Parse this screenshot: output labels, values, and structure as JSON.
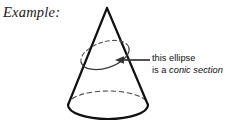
{
  "figure": {
    "label": "Example:",
    "type": "cone-conic-section-diagram",
    "colors": {
      "stroke": "#111111",
      "dashed_stroke": "#555555",
      "arrow": "#333333",
      "text": "#111111",
      "background": "#ffffff"
    },
    "shapes": {
      "cone": {
        "name": "cone",
        "apex": {
          "x": 107,
          "y": 8
        },
        "base_center": {
          "x": 108,
          "y": 105
        },
        "base_rx": 40,
        "base_ry": 14,
        "base_front_style": "solid",
        "base_back_style": "dashed"
      },
      "cross_section_ellipse": {
        "name": "conic-section-ellipse",
        "center": {
          "x": 105,
          "y": 55
        },
        "rx": 25,
        "ry": 13,
        "rotation_deg": -18,
        "front_style": "solid",
        "back_style": "dashed"
      },
      "arrow": {
        "name": "callout-arrow",
        "from": {
          "x": 150,
          "y": 60
        },
        "to": {
          "x": 116,
          "y": 60
        },
        "direction": "left"
      }
    }
  },
  "callout": {
    "line1": "this ellipse",
    "line2_prefix": "is a ",
    "line2_term": "conic section"
  }
}
